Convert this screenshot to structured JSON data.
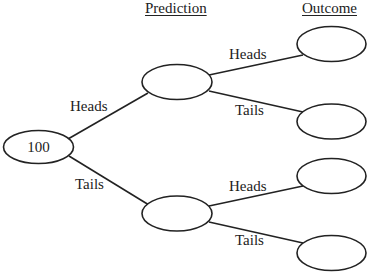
{
  "headers": {
    "prediction": "Prediction",
    "outcome": "Outcome"
  },
  "root": {
    "label": "100"
  },
  "edges": {
    "root_to_top": "Heads",
    "root_to_bottom": "Tails",
    "top_to_o1": "Heads",
    "top_to_o2": "Tails",
    "bottom_to_o3": "Heads",
    "bottom_to_o4": "Tails"
  },
  "nodes": {
    "prediction_heads": {
      "label": ""
    },
    "prediction_tails": {
      "label": ""
    },
    "outcome_1": {
      "label": ""
    },
    "outcome_2": {
      "label": ""
    },
    "outcome_3": {
      "label": ""
    },
    "outcome_4": {
      "label": ""
    }
  },
  "colors": {
    "stroke": "#222222",
    "background": "#ffffff"
  }
}
